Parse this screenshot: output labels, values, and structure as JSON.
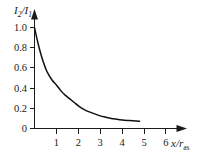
{
  "chart_data": {
    "type": "line",
    "title": "",
    "subtitle": "",
    "xlabel": "x/r_as",
    "ylabel": "I_2/I_1",
    "xlabel_parts": {
      "base": "x/r",
      "subscript": "as"
    },
    "ylabel_parts": {
      "numerator_base": "I",
      "numerator_sub": "2",
      "denominator_base": "I",
      "denominator_sub": "1",
      "separator": "/"
    },
    "xlim": [
      0,
      6.6
    ],
    "ylim": [
      0,
      1.12
    ],
    "xticks": [
      1,
      2,
      3,
      4,
      5,
      6
    ],
    "xtick_labels": [
      "1",
      "2",
      "3",
      "4",
      "5",
      "6"
    ],
    "yticks": [
      0,
      0.2,
      0.4,
      0.6,
      0.8,
      1.0
    ],
    "ytick_labels": [
      "0",
      "0.2",
      "0.4",
      "0.6",
      "0.8",
      "1.0"
    ],
    "grid": false,
    "legend": null,
    "legend_position": "none",
    "axis_style": "arrow-tipped",
    "tick_direction": "outward",
    "line_color": "#111111",
    "axis_color": "#1a1a1a",
    "background_color": "#ffffff",
    "series": [
      {
        "name": "I2/I1 decay",
        "x": [
          0.0,
          0.1,
          0.2,
          0.3,
          0.4,
          0.5,
          0.6,
          0.8,
          1.0,
          1.2,
          1.4,
          1.6,
          1.8,
          2.0,
          2.25,
          2.5,
          2.75,
          3.0,
          3.25,
          3.5,
          3.75,
          4.0,
          4.25,
          4.5,
          4.8
        ],
        "values": [
          1.0,
          0.9,
          0.81,
          0.73,
          0.66,
          0.6,
          0.55,
          0.48,
          0.43,
          0.375,
          0.33,
          0.295,
          0.26,
          0.225,
          0.19,
          0.165,
          0.145,
          0.125,
          0.112,
          0.1,
          0.092,
          0.085,
          0.08,
          0.076,
          0.072
        ]
      }
    ],
    "annotations": []
  }
}
